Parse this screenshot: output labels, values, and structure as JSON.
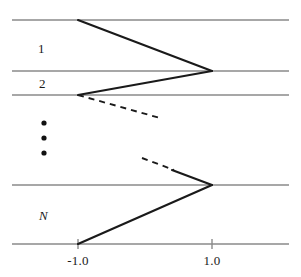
{
  "figure": {
    "title": "",
    "background_color": "#ffffff",
    "grid_line_color": "#8a8a8a",
    "curve_color": "#1a1a1a",
    "band_labels": [
      {
        "text": "1",
        "x": 38,
        "y": 41,
        "italic": false,
        "name": "band-label-1"
      },
      {
        "text": "2",
        "x": 39,
        "y": 76,
        "italic": false,
        "name": "band-label-2"
      },
      {
        "text": "N",
        "x": 39,
        "y": 208,
        "italic": true,
        "name": "band-label-n"
      }
    ],
    "vertical_dots": {
      "name": "vertical-ellipsis",
      "x": 44,
      "ys": [
        123,
        138,
        153
      ],
      "radius": 2.6,
      "color": "#111111"
    },
    "x_axis": {
      "name": "x-axis",
      "y": 244,
      "tick_length": 5,
      "ticks": [
        {
          "label": "-1.0",
          "x": 78
        },
        {
          "label": "1.0",
          "x": 212
        }
      ]
    },
    "horizontal_lines": [
      {
        "name": "level-line-0",
        "y": 20
      },
      {
        "name": "level-line-1",
        "y": 71
      },
      {
        "name": "level-line-2",
        "y": 95
      },
      {
        "name": "level-line-3",
        "y": 185
      },
      {
        "name": "level-line-4",
        "y": 244
      }
    ],
    "solid_segments": [
      {
        "name": "band-1-upper-branch",
        "x1": 78,
        "y1": 20,
        "x2": 212,
        "y2": 71
      },
      {
        "name": "band-1-lower-branch",
        "x1": 212,
        "y1": 71,
        "x2": 78,
        "y2": 95
      },
      {
        "name": "band-n-upper-branch",
        "x1": 172,
        "y1": 170,
        "x2": 212,
        "y2": 185
      },
      {
        "name": "band-n-lower-branch",
        "x1": 212,
        "y1": 185,
        "x2": 78,
        "y2": 244
      }
    ],
    "dashed_segments": [
      {
        "name": "band-2-dashed-continuation",
        "x1": 78,
        "y1": 95,
        "x2": 160,
        "y2": 118
      },
      {
        "name": "band-n-dashed-continuation",
        "x1": 142,
        "y1": 158,
        "x2": 174,
        "y2": 170
      }
    ]
  }
}
